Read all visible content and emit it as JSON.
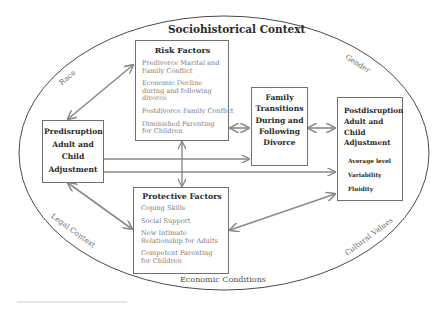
{
  "diagram": {
    "context_title": "Sociohistorical Context",
    "ring_labels": {
      "race": "Race",
      "gender": "Gender",
      "legal_context": "Legal Context",
      "cultural_values": "Cultural Values",
      "economic_conditions": "Economic Conditions"
    },
    "risk_factors": {
      "title": "Risk Factors",
      "items": [
        "Predivorce Marital and Family Conflict",
        "Economic Decline during and following divorce",
        "Postdivorce Family Conflict",
        "Diminished Parenting for Children"
      ]
    },
    "protective_factors": {
      "title": "Protective Factors",
      "items": [
        "Coping Skills",
        "Social Support",
        "New Intimate Relationship for Adults",
        "Competent Parenting for Children"
      ]
    },
    "predisruption": {
      "title": "Predisruption Adult and Child Adjustment"
    },
    "family_transitions": {
      "title": "Family Transitions During and Following Divorce"
    },
    "postdisruption": {
      "title": "Postdisruption Adult and Child Adjustment",
      "items": [
        "Average level",
        "Variability",
        "Fluidity"
      ]
    },
    "colors": {
      "outline": "#4a4a4a",
      "box_border": "#6f6f6f",
      "arrow": "#8a8a8a",
      "title_text": "#2a2a2a",
      "item_text": "#7d7d80"
    }
  }
}
